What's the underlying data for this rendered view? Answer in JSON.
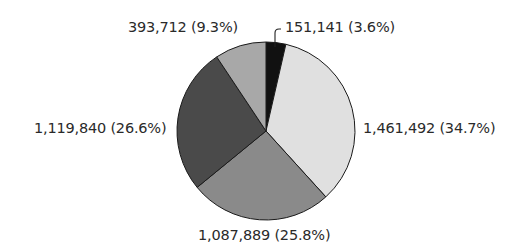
{
  "chart_data": {
    "type": "pie",
    "title": "",
    "start_angle_deg": 0,
    "direction": "clockwise",
    "slices": [
      {
        "label": "151,141 (3.6%)",
        "value": 151141,
        "percent": 3.6,
        "color": "#111111"
      },
      {
        "label": "1,461,492 (34.7%)",
        "value": 1461492,
        "percent": 34.7,
        "color": "#e0e0e0"
      },
      {
        "label": "1,087,889 (25.8%)",
        "value": 1087889,
        "percent": 25.8,
        "color": "#8a8a8a"
      },
      {
        "label": "1,119,840 (26.6%)",
        "value": 1119840,
        "percent": 26.6,
        "color": "#4a4a4a"
      },
      {
        "label": "393,712 (9.3%)",
        "value": 393712,
        "percent": 9.3,
        "color": "#a8a8a8"
      }
    ],
    "legend": null
  },
  "labels": {
    "slice_0": "151,141 (3.6%)",
    "slice_1": "1,461,492 (34.7%)",
    "slice_2": "1,087,889 (25.8%)",
    "slice_3": "1,119,840 (26.6%)",
    "slice_4": "393,712 (9.3%)"
  }
}
